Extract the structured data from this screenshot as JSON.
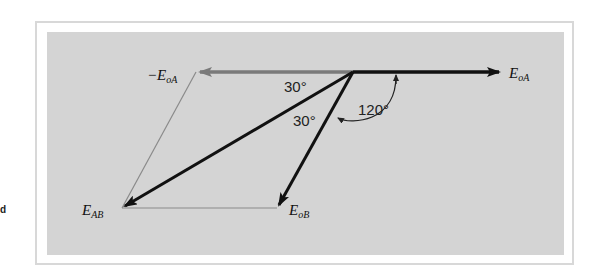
{
  "diagram": {
    "type": "phasor-diagram",
    "labels": {
      "e_oa": "E",
      "e_oa_sub": "oA",
      "neg_e_oa_prefix": "−E",
      "neg_e_oa_sub": "oA",
      "e_ab": "E",
      "e_ab_sub": "AB",
      "e_ob": "E",
      "e_ob_sub": "oB"
    },
    "angles": {
      "angle_top": "30°",
      "angle_mid": "30°",
      "angle_120": "120°"
    },
    "phasors": [
      {
        "name": "E_oA",
        "from": [
          353,
          72
        ],
        "to": [
          501,
          72
        ],
        "color": "#111111"
      },
      {
        "name": "-E_oA",
        "from": [
          353,
          72
        ],
        "to": [
          196,
          72
        ],
        "color": "#7a7a7a"
      },
      {
        "name": "E_AB",
        "from": [
          353,
          72
        ],
        "to": [
          122,
          208
        ],
        "color": "#111111"
      },
      {
        "name": "E_oB",
        "from": [
          353,
          72
        ],
        "to": [
          277,
          208
        ],
        "color": "#111111"
      }
    ],
    "construction_lines": [
      {
        "from": [
          196,
          72
        ],
        "to": [
          122,
          208
        ],
        "color": "#8a8a8a"
      },
      {
        "from": [
          122,
          208
        ],
        "to": [
          277,
          208
        ],
        "color": "#8a8a8a"
      }
    ],
    "colors": {
      "background": "#d4d4d4",
      "frame": "#d8d8d8",
      "phasor": "#111111",
      "negated_phasor": "#7a7a7a"
    }
  },
  "edge_mark": "d"
}
